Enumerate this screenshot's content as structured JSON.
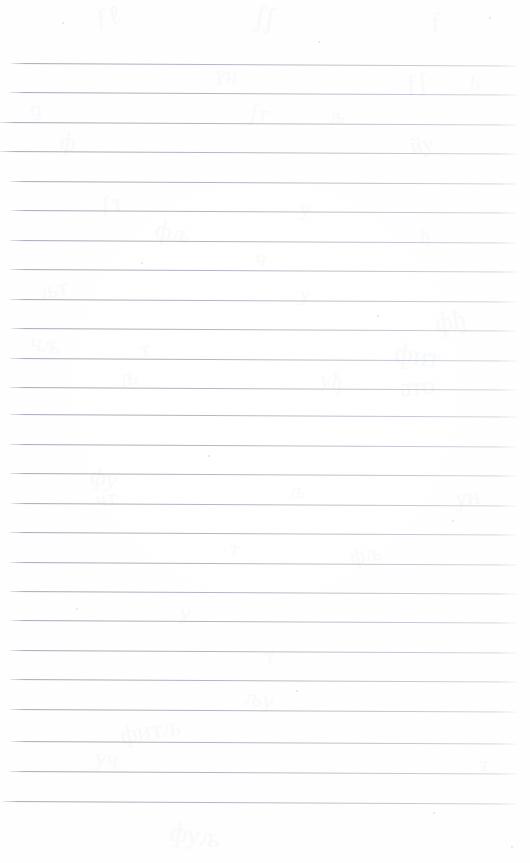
{
  "page": {
    "kind": "scanned-lined-notebook-page",
    "width": 530,
    "height": 863,
    "background_color": "#ffffff",
    "paper_tone": "#fefefe",
    "rule_color": "#a8adb7",
    "has_visible_text": false,
    "has_handwriting": false,
    "margin_rule_present": false,
    "alt_text": ""
  },
  "ruling": {
    "line_count": 26,
    "first_line_y": 63,
    "spacing_px": 29.5,
    "line_start_x": 10,
    "line_end_x": 517,
    "line_thickness_px": 1,
    "slant_deg": 0.28
  },
  "rules": [
    {
      "y": 63,
      "x": 11,
      "w": 506,
      "faint": false
    },
    {
      "y": 92,
      "x": 10,
      "w": 507,
      "faint": false
    },
    {
      "y": 122,
      "x": 0,
      "w": 517,
      "faint": false
    },
    {
      "y": 151,
      "x": 0,
      "w": 517,
      "faint": false
    },
    {
      "y": 181,
      "x": 10,
      "w": 507,
      "faint": false
    },
    {
      "y": 210,
      "x": 11,
      "w": 505,
      "faint": false
    },
    {
      "y": 240,
      "x": 10,
      "w": 506,
      "faint": false
    },
    {
      "y": 269,
      "x": 10,
      "w": 507,
      "faint": false
    },
    {
      "y": 299,
      "x": 10,
      "w": 506,
      "faint": false
    },
    {
      "y": 328,
      "x": 11,
      "w": 505,
      "faint": false
    },
    {
      "y": 358,
      "x": 10,
      "w": 507,
      "faint": false
    },
    {
      "y": 387,
      "x": 10,
      "w": 506,
      "faint": false
    },
    {
      "y": 414,
      "x": 10,
      "w": 507,
      "faint": false
    },
    {
      "y": 444,
      "x": 10,
      "w": 506,
      "faint": false
    },
    {
      "y": 473,
      "x": 10,
      "w": 506,
      "faint": false
    },
    {
      "y": 503,
      "x": 11,
      "w": 505,
      "faint": false
    },
    {
      "y": 532,
      "x": 10,
      "w": 506,
      "faint": false
    },
    {
      "y": 562,
      "x": 10,
      "w": 507,
      "faint": false
    },
    {
      "y": 591,
      "x": 10,
      "w": 506,
      "faint": false
    },
    {
      "y": 620,
      "x": 11,
      "w": 505,
      "faint": false
    },
    {
      "y": 650,
      "x": 10,
      "w": 506,
      "faint": false
    },
    {
      "y": 679,
      "x": 10,
      "w": 507,
      "faint": false
    },
    {
      "y": 709,
      "x": 10,
      "w": 506,
      "faint": false
    },
    {
      "y": 741,
      "x": 11,
      "w": 505,
      "faint": false
    },
    {
      "y": 771,
      "x": 10,
      "w": 506,
      "faint": false
    },
    {
      "y": 801,
      "x": 3,
      "w": 514,
      "faint": false
    }
  ],
  "bleed_through": [
    {
      "x": 95,
      "y": 2,
      "size": 26,
      "rot": -12,
      "mark": "ƒℓ"
    },
    {
      "x": 255,
      "y": 0,
      "size": 30,
      "rot": 8,
      "mark": "ʃʃ"
    },
    {
      "x": 430,
      "y": 8,
      "size": 24,
      "rot": -6,
      "mark": "ƒ"
    },
    {
      "x": 215,
      "y": 62,
      "size": 22,
      "rot": 10,
      "mark": "ɣи"
    },
    {
      "x": 405,
      "y": 68,
      "size": 26,
      "rot": -9,
      "mark": "ƒʃ"
    },
    {
      "x": 470,
      "y": 72,
      "size": 20,
      "rot": 5,
      "mark": "һ"
    },
    {
      "x": 30,
      "y": 96,
      "size": 22,
      "rot": -7,
      "mark": "ɡ"
    },
    {
      "x": 250,
      "y": 100,
      "size": 24,
      "rot": 11,
      "mark": "ʃт"
    },
    {
      "x": 330,
      "y": 104,
      "size": 21,
      "rot": -5,
      "mark": "љ"
    },
    {
      "x": 60,
      "y": 128,
      "size": 25,
      "rot": 9,
      "mark": "ф"
    },
    {
      "x": 410,
      "y": 132,
      "size": 23,
      "rot": -10,
      "mark": "йу"
    },
    {
      "x": 100,
      "y": 190,
      "size": 24,
      "rot": -8,
      "mark": "ƒт"
    },
    {
      "x": 300,
      "y": 196,
      "size": 22,
      "rot": 7,
      "mark": "у"
    },
    {
      "x": 155,
      "y": 218,
      "size": 26,
      "rot": 12,
      "mark": "фљ"
    },
    {
      "x": 420,
      "y": 224,
      "size": 20,
      "rot": -6,
      "mark": "ђ"
    },
    {
      "x": 255,
      "y": 246,
      "size": 23,
      "rot": 8,
      "mark": "ч"
    },
    {
      "x": 40,
      "y": 276,
      "size": 24,
      "rot": -11,
      "mark": "љт"
    },
    {
      "x": 300,
      "y": 282,
      "size": 21,
      "rot": 6,
      "mark": "у"
    },
    {
      "x": 435,
      "y": 306,
      "size": 27,
      "rot": -9,
      "mark": "фђ"
    },
    {
      "x": 30,
      "y": 330,
      "size": 25,
      "rot": 10,
      "mark": "чљ"
    },
    {
      "x": 140,
      "y": 336,
      "size": 22,
      "rot": -7,
      "mark": "т"
    },
    {
      "x": 395,
      "y": 340,
      "size": 28,
      "rot": 8,
      "mark": "фит"
    },
    {
      "x": 120,
      "y": 364,
      "size": 24,
      "rot": -10,
      "mark": "љ"
    },
    {
      "x": 320,
      "y": 368,
      "size": 23,
      "rot": 9,
      "mark": "уђ"
    },
    {
      "x": 400,
      "y": 372,
      "size": 26,
      "rot": -5,
      "mark": "ато"
    },
    {
      "x": 90,
      "y": 464,
      "size": 25,
      "rot": 11,
      "mark": "фу"
    },
    {
      "x": 95,
      "y": 486,
      "size": 23,
      "rot": -8,
      "mark": "чт"
    },
    {
      "x": 290,
      "y": 478,
      "size": 22,
      "rot": 7,
      "mark": "љ"
    },
    {
      "x": 455,
      "y": 484,
      "size": 24,
      "rot": -6,
      "mark": "ун"
    },
    {
      "x": 230,
      "y": 536,
      "size": 21,
      "rot": 9,
      "mark": "т"
    },
    {
      "x": 350,
      "y": 542,
      "size": 23,
      "rot": -10,
      "mark": "фљ"
    },
    {
      "x": 180,
      "y": 600,
      "size": 22,
      "rot": 8,
      "mark": "у"
    },
    {
      "x": 265,
      "y": 644,
      "size": 21,
      "rot": -7,
      "mark": "т"
    },
    {
      "x": 245,
      "y": 686,
      "size": 24,
      "rot": 10,
      "mark": "љу"
    },
    {
      "x": 120,
      "y": 716,
      "size": 26,
      "rot": -9,
      "mark": "фитљ"
    },
    {
      "x": 95,
      "y": 746,
      "size": 23,
      "rot": 7,
      "mark": "уч"
    },
    {
      "x": 480,
      "y": 752,
      "size": 21,
      "rot": -6,
      "mark": "т"
    },
    {
      "x": 170,
      "y": 820,
      "size": 27,
      "rot": 9,
      "mark": "фуљ"
    }
  ],
  "speckles": [
    {
      "x": 62,
      "y": 22,
      "d": 2
    },
    {
      "x": 318,
      "y": 41,
      "d": 2
    },
    {
      "x": 489,
      "y": 17,
      "d": 2
    },
    {
      "x": 141,
      "y": 262,
      "d": 2
    },
    {
      "x": 377,
      "y": 315,
      "d": 2
    },
    {
      "x": 208,
      "y": 455,
      "d": 2
    },
    {
      "x": 452,
      "y": 520,
      "d": 2
    },
    {
      "x": 76,
      "y": 608,
      "d": 2
    },
    {
      "x": 296,
      "y": 690,
      "d": 2
    },
    {
      "x": 433,
      "y": 812,
      "d": 2
    },
    {
      "x": 511,
      "y": 846,
      "d": 2
    }
  ]
}
